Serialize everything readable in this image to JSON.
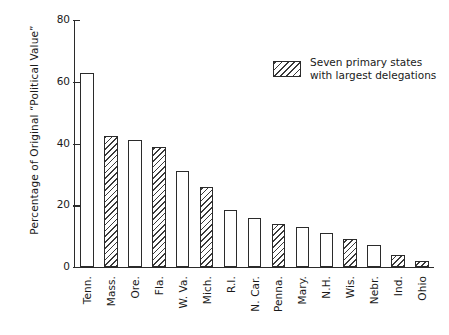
{
  "chart_data": {
    "type": "bar",
    "title": "",
    "xlabel": "",
    "ylabel": "Percentage of Original “Political Value”",
    "ylim": [
      0,
      80
    ],
    "yticks": [
      0,
      20,
      40,
      60,
      80
    ],
    "grid": false,
    "legend_position": "upper-right",
    "categories": [
      "Tenn.",
      "Mass.",
      "Ore.",
      "Fla.",
      "W. Va.",
      "Mich.",
      "R.I.",
      "N. Car.",
      "Penna.",
      "Mary.",
      "N.H.",
      "Wis.",
      "Nebr.",
      "Ind.",
      "Ohio"
    ],
    "values": [
      63,
      42.5,
      41,
      39,
      31,
      26,
      18.5,
      16,
      14,
      13,
      11,
      9,
      7,
      4,
      2
    ],
    "series": [
      {
        "name": "Seven primary states with largest delegations",
        "fill": "hatched",
        "members": [
          "Mass.",
          "Fla.",
          "Mich.",
          "Penna.",
          "Wis.",
          "Ind.",
          "Ohio"
        ]
      },
      {
        "name": "Other primary states",
        "fill": "open",
        "members": [
          "Tenn.",
          "Ore.",
          "W. Va.",
          "R.I.",
          "N. Car.",
          "Mary.",
          "N.H.",
          "Nebr."
        ]
      }
    ],
    "bar_styles": [
      "open",
      "hatched",
      "open",
      "hatched",
      "open",
      "hatched",
      "open",
      "open",
      "hatched",
      "open",
      "open",
      "hatched",
      "open",
      "hatched",
      "hatched"
    ]
  },
  "legend": {
    "line1": "Seven primary states",
    "line2": "with largest delegations"
  },
  "colors": {
    "ink": "#2b2b2b",
    "hatch": "#3a3a3a",
    "background": "#ffffff"
  }
}
